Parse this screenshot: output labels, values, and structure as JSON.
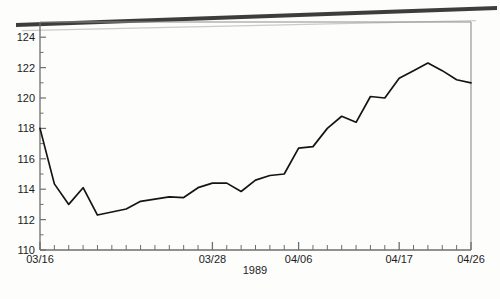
{
  "chart_data": {
    "type": "line",
    "title": "",
    "subtitle": "",
    "xlabel": "1989",
    "ylabel": "",
    "xlim": [
      0,
      30
    ],
    "ylim": [
      110,
      125
    ],
    "grid": false,
    "legend": null,
    "y_ticks": [
      110,
      112,
      114,
      116,
      118,
      120,
      122,
      124
    ],
    "y_tick_labels": [
      "110",
      "112",
      "114",
      "116",
      "118",
      "120",
      "122",
      "124"
    ],
    "y_minor_tick_count": 31,
    "x_tick_count": 31,
    "x_labeled_ticks": [
      {
        "index": 0,
        "label": "03/16"
      },
      {
        "index": 12,
        "label": "03/28"
      },
      {
        "index": 18,
        "label": "04/06"
      },
      {
        "index": 25,
        "label": "04/17"
      },
      {
        "index": 30,
        "label": "04/26"
      }
    ],
    "x": [
      0,
      1,
      2,
      3,
      4,
      5,
      6,
      7,
      8,
      9,
      10,
      11,
      12,
      13,
      14,
      15,
      16,
      17,
      18,
      19,
      20,
      21,
      22,
      23,
      24,
      25,
      26,
      27,
      28,
      29,
      30
    ],
    "categories": [
      "03/16",
      "03/17",
      "03/18",
      "03/19",
      "03/20",
      "03/21",
      "03/22",
      "03/23",
      "03/24",
      "03/25",
      "03/26",
      "03/27",
      "03/28",
      "03/29",
      "03/30",
      "03/31",
      "04/01",
      "04/02",
      "04/06",
      "04/07",
      "04/08",
      "04/09",
      "04/10",
      "04/11",
      "04/14",
      "04/17",
      "04/18",
      "04/19",
      "04/20",
      "04/21",
      "04/26"
    ],
    "values": [
      118.0,
      114.35,
      113.0,
      114.1,
      112.3,
      112.5,
      112.7,
      113.2,
      113.35,
      113.5,
      113.45,
      114.1,
      114.4,
      114.4,
      113.85,
      114.6,
      114.9,
      115.0,
      116.7,
      116.8,
      118.0,
      118.8,
      118.4,
      120.1,
      120.0,
      121.3,
      121.8,
      122.3,
      121.8,
      121.2,
      121.0
    ],
    "series": [
      {
        "name": "series-1",
        "color": "#141414",
        "values": [
          118.0,
          114.35,
          113.0,
          114.1,
          112.3,
          112.5,
          112.7,
          113.2,
          113.35,
          113.5,
          113.45,
          114.1,
          114.4,
          114.4,
          113.85,
          114.6,
          114.9,
          115.0,
          116.7,
          116.8,
          118.0,
          118.8,
          118.4,
          120.1,
          120.0,
          121.3,
          121.8,
          122.3,
          121.8,
          121.2,
          121.0
        ]
      }
    ],
    "annotations": [],
    "colors": {
      "line": "#141414",
      "axis": "#6e6e6e",
      "text": "#1b1b1b",
      "background": "#fdfdfc",
      "scan_artifact": "#2a2a2a"
    }
  }
}
